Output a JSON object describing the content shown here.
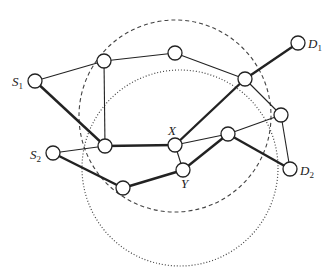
{
  "diagram": {
    "type": "network-graph",
    "circles": [
      {
        "id": "dashed-range",
        "style": "dashed",
        "cx": 175,
        "cy": 116,
        "r": 96
      },
      {
        "id": "dotted-range",
        "style": "dotted",
        "cx": 180,
        "cy": 168,
        "r": 98
      }
    ],
    "nodes": [
      {
        "id": "S1",
        "x": 35,
        "y": 81,
        "label": "S",
        "sub": "1",
        "lx": 12,
        "ly": 86
      },
      {
        "id": "A",
        "x": 104,
        "y": 61
      },
      {
        "id": "B",
        "x": 175,
        "y": 53
      },
      {
        "id": "C",
        "x": 245,
        "y": 79
      },
      {
        "id": "D1",
        "x": 298,
        "y": 43,
        "label": "D",
        "sub": "1",
        "lx": 308,
        "ly": 48
      },
      {
        "id": "L",
        "x": 105,
        "y": 146
      },
      {
        "id": "X",
        "x": 175,
        "y": 145,
        "label": "X",
        "sub": "",
        "lx": 168,
        "ly": 135
      },
      {
        "id": "R",
        "x": 228,
        "y": 134
      },
      {
        "id": "E",
        "x": 281,
        "y": 115
      },
      {
        "id": "S2",
        "x": 53,
        "y": 153,
        "label": "S",
        "sub": "2",
        "lx": 30,
        "ly": 159
      },
      {
        "id": "M",
        "x": 123,
        "y": 188
      },
      {
        "id": "Y",
        "x": 183,
        "y": 170,
        "label": "Y",
        "sub": "",
        "lx": 181,
        "ly": 188
      },
      {
        "id": "D2",
        "x": 290,
        "y": 169,
        "label": "D",
        "sub": "2",
        "lx": 300,
        "ly": 175
      }
    ],
    "edges": [
      {
        "from": "S1",
        "to": "A",
        "bold": false
      },
      {
        "from": "S1",
        "to": "L",
        "bold": true
      },
      {
        "from": "A",
        "to": "B",
        "bold": false
      },
      {
        "from": "A",
        "to": "L",
        "bold": false
      },
      {
        "from": "B",
        "to": "C",
        "bold": false
      },
      {
        "from": "C",
        "to": "D1",
        "bold": true
      },
      {
        "from": "X",
        "to": "C",
        "bold": true
      },
      {
        "from": "C",
        "to": "E",
        "bold": false
      },
      {
        "from": "L",
        "to": "X",
        "bold": true
      },
      {
        "from": "L",
        "to": "S2",
        "bold": false
      },
      {
        "from": "X",
        "to": "R",
        "bold": false
      },
      {
        "from": "X",
        "to": "Y",
        "bold": false
      },
      {
        "from": "R",
        "to": "E",
        "bold": false
      },
      {
        "from": "R",
        "to": "D2",
        "bold": true
      },
      {
        "from": "E",
        "to": "D2",
        "bold": false
      },
      {
        "from": "S2",
        "to": "M",
        "bold": true
      },
      {
        "from": "M",
        "to": "Y",
        "bold": true
      },
      {
        "from": "Y",
        "to": "R",
        "bold": true
      }
    ],
    "node_radius": 7,
    "colors": {
      "stroke": "#222222",
      "node_fill": "#ffffff",
      "circle_stroke": "#444444"
    }
  }
}
